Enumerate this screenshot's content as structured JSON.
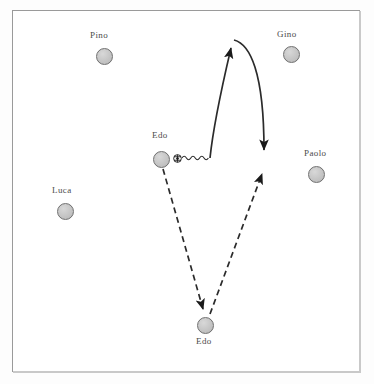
{
  "diagram": {
    "field": {
      "background_color": "#ffffff",
      "border_color": "#9a9a9a"
    },
    "colors": {
      "player_fill": "#c5c5c5",
      "player_stroke": "#6f6f6f",
      "arrow_color": "#1a1a1a",
      "label_color": "#4b4b4b"
    },
    "players": [
      {
        "id": "pino",
        "label": "Pino",
        "cx": 104,
        "cy": 56,
        "label_x": 90,
        "label_y": 33
      },
      {
        "id": "gino",
        "label": "Gino",
        "cx": 291,
        "cy": 54,
        "label_x": 277,
        "label_y": 32
      },
      {
        "id": "edo-top",
        "label": "Edo",
        "cx": 161,
        "cy": 159,
        "label_x": 152,
        "label_y": 133
      },
      {
        "id": "paolo",
        "label": "Paolo",
        "cx": 316,
        "cy": 174,
        "label_x": 305,
        "label_y": 151
      },
      {
        "id": "luca",
        "label": "Luca",
        "cx": 65,
        "cy": 211,
        "label_x": 53,
        "label_y": 188
      },
      {
        "id": "edo-bottom",
        "label": "Edo",
        "cx": 205,
        "cy": 325,
        "label_x": 196,
        "label_y": 338
      }
    ],
    "ball": {
      "name": "soccer-ball",
      "x": 173,
      "y": 154
    },
    "movements": [
      {
        "id": "dribble-wave",
        "type": "dribble",
        "style": "wavy",
        "from_x": 182,
        "to_x": 210,
        "y": 158
      },
      {
        "id": "run-up-and-curve-down",
        "type": "run",
        "style": "solid-curved-arrow",
        "arrowheads": 2,
        "start": [
          210,
          158
        ],
        "peak": [
          233,
          40
        ],
        "end": [
          264,
          160
        ]
      },
      {
        "id": "pass-down-left",
        "type": "pass",
        "style": "dashed-arrow",
        "start": [
          162,
          168
        ],
        "end": [
          204,
          315
        ]
      },
      {
        "id": "pass-up-right",
        "type": "pass",
        "style": "dashed-arrow",
        "start": [
          210,
          315
        ],
        "end": [
          264,
          167
        ]
      }
    ]
  }
}
